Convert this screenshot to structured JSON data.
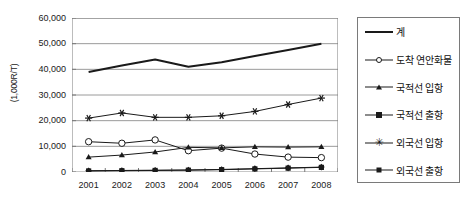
{
  "chart_data": {
    "type": "line",
    "title": "",
    "subtitle": "",
    "xlabel": "",
    "ylabel": "(1,000R/T)",
    "categories": [
      "2001",
      "2002",
      "2003",
      "2004",
      "2005",
      "2006",
      "2007",
      "2008"
    ],
    "x": [
      2001,
      2002,
      2003,
      2004,
      2005,
      2006,
      2007,
      2008
    ],
    "ylim": [
      0,
      60000
    ],
    "yticks": [
      0,
      10000,
      20000,
      30000,
      40000,
      50000,
      60000
    ],
    "ytick_labels": [
      "0",
      "10,000",
      "20,000",
      "30,000",
      "40,000",
      "50,000",
      "60,000"
    ],
    "grid": true,
    "grid_axis": "y",
    "legend_position": "right",
    "series": [
      {
        "name": "계",
        "marker": "none",
        "line_width": 2,
        "values": [
          39000,
          41500,
          43800,
          41000,
          42800,
          45200,
          47500,
          50000
        ]
      },
      {
        "name": "도시 연안화물",
        "label": "도착 연안화물",
        "marker": "circle-open",
        "line_width": 1,
        "values": [
          11800,
          11200,
          12500,
          8300,
          9300,
          7000,
          5800,
          5600
        ]
      },
      {
        "name": "국적선 입항",
        "marker": "triangle",
        "line_width": 1,
        "values": [
          5800,
          6600,
          7800,
          9600,
          9400,
          9800,
          9700,
          9800
        ]
      },
      {
        "name": "국적선 우항",
        "label": "국적선 우항",
        "marker": "square",
        "line_width": 1,
        "values": [
          400,
          500,
          600,
          700,
          900,
          1200,
          1500,
          1800
        ]
      },
      {
        "name": "외국선 입항",
        "marker": "star",
        "line_width": 1,
        "values": [
          21000,
          23000,
          21300,
          21300,
          21900,
          23600,
          26300,
          28800
        ]
      },
      {
        "name": "외국선 우항",
        "label": "외국선 우항",
        "marker": "diamond",
        "line_width": 1,
        "values": [
          500,
          600,
          700,
          800,
          1000,
          1300,
          1600,
          1900
        ]
      }
    ]
  },
  "axis": {
    "ylabel": "(1,000R/T)",
    "ytick_labels": [
      "60,000",
      "50,000",
      "40,000",
      "30,000",
      "20,000",
      "10,000",
      "0"
    ],
    "xtick_labels": [
      "2001",
      "2002",
      "2003",
      "2004",
      "2005",
      "2006",
      "2007",
      "2008"
    ]
  },
  "legend": {
    "items": [
      {
        "label": "계",
        "marker": "plain-line"
      },
      {
        "label": "도착 연안화물",
        "marker": "open-circle"
      },
      {
        "label": "국적선 입항",
        "marker": "triangle"
      },
      {
        "label": "국적선 출항",
        "marker": "filled-square"
      },
      {
        "label": "외국선 입항",
        "marker": "star"
      },
      {
        "label": "외국선 출항",
        "marker": "filled-diamond"
      }
    ]
  },
  "colors": {
    "line": "#1a1a1a",
    "grid": "#8f8f8f",
    "axis": "#7a7a7a",
    "text": "#1a1a1a",
    "background": "#ffffff"
  }
}
